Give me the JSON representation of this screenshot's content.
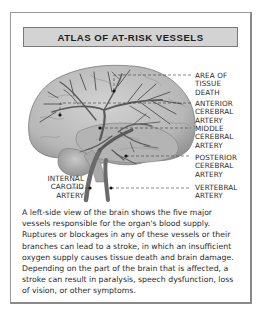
{
  "title": "ATLAS OF AT-RISK VESSELS",
  "labels": {
    "tissue_death": [
      "AREA OF",
      "TISSUE",
      "DEATH"
    ],
    "anterior": [
      "ANTERIOR",
      "CEREBRAL",
      "ARTERY"
    ],
    "middle": [
      "MIDDLE",
      "CEREBRAL",
      "ARTERY"
    ],
    "posterior": [
      "POSTERIOR",
      "CEREBRAL",
      "ARTERY"
    ],
    "internal_carotid": [
      "INTERNAL",
      "CAROTID",
      "ARTERY"
    ],
    "vertebral": [
      "VERTEBRAL",
      "ARTERY"
    ]
  },
  "caption": "A left-side view of the brain shows the five major vessels responsible for the organ's blood supply. Ruptures or blockages in any of these vessels or their branches can lead to a stroke, in which an insufficient oxygen supply causes tissue death and brain damage. Depending on the part of the brain that is affected, a stroke can result in paralysis, speech dysfunction, loss of vision, or other symptoms.",
  "colors": {
    "title_bg": "#d3d3d3",
    "frame_border": "#9a9a9a",
    "brain_fill": "#bdbdbd",
    "vessel": "#5a5a5a"
  }
}
